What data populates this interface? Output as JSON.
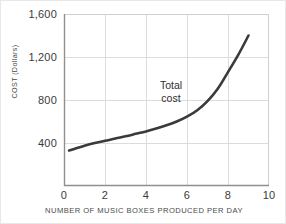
{
  "chart_data": {
    "type": "line",
    "title": "",
    "xlabel": "NUMBER OF MUSIC BOXES PRODUCED PER DAY",
    "ylabel": "COST (Dollars)",
    "xlim": [
      0,
      10
    ],
    "ylim": [
      0,
      1600
    ],
    "xticks": [
      "0",
      "2",
      "4",
      "6",
      "8",
      "10"
    ],
    "xtick_values": [
      0,
      2,
      4,
      6,
      8,
      10
    ],
    "yticks": [
      "400",
      "800",
      "1,200",
      "1,600"
    ],
    "ytick_values": [
      400,
      800,
      1200,
      1600
    ],
    "grid": true,
    "legend": "none",
    "series": [
      {
        "name": "Total cost",
        "x": [
          0.25,
          0.5,
          1,
          1.5,
          2,
          2.5,
          3,
          3.5,
          4,
          4.5,
          5,
          5.5,
          6,
          6.5,
          7,
          7.5,
          8,
          8.5,
          9
        ],
        "values": [
          330,
          345,
          375,
          400,
          420,
          442,
          462,
          485,
          508,
          535,
          565,
          600,
          645,
          705,
          790,
          905,
          1060,
          1220,
          1400
        ]
      }
    ],
    "annotations": [
      {
        "name": "total-cost-label",
        "lines": [
          "Total",
          "cost"
        ],
        "x": 4.9,
        "y": 905
      }
    ],
    "colors": {
      "curve": "#3a3a3a",
      "grid": "#dcdcdc",
      "axis": "#9a9a9a",
      "text": "#3b3b3b",
      "background": "#ffffff"
    }
  }
}
